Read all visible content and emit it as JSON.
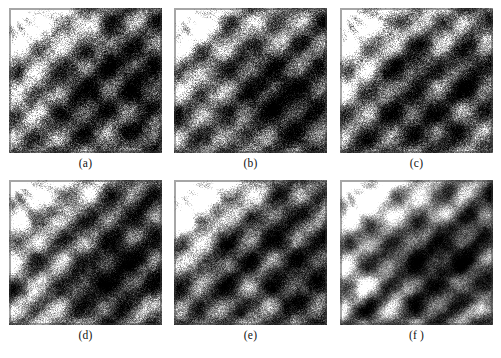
{
  "figure": {
    "background_color": "#ffffff",
    "caption_color": "#121212",
    "rows": 2,
    "columns": 3,
    "panel_width_px": 153,
    "panel_height_px": 145,
    "panels": [
      {
        "id": "panel-a",
        "caption": "(a)",
        "row": 1,
        "column": 1,
        "description": "grayscale speckled SAR-like texture with bright fan-shaped region upper-left and dark diagonal ridges",
        "seed": 11,
        "speckle_density": 0.95,
        "smoothing": 0,
        "mean_gray": "#4a4a4a"
      },
      {
        "id": "panel-b",
        "caption": "(b)",
        "row": 1,
        "column": 2,
        "description": "grayscale speckled SAR-like texture, bright upper-left lobe, dark diagonal striations",
        "seed": 23,
        "speckle_density": 0.92,
        "smoothing": 1,
        "mean_gray": "#464646"
      },
      {
        "id": "panel-c",
        "caption": "(c)",
        "row": 1,
        "column": 3,
        "description": "grayscale speckled SAR-like texture, high contrast diagonal bands",
        "seed": 37,
        "speckle_density": 0.9,
        "smoothing": 1,
        "mean_gray": "#484848"
      },
      {
        "id": "panel-d",
        "caption": "(d)",
        "row": 2,
        "column": 1,
        "description": "grayscale filtered SAR-like texture, reduced speckle, radial bright streaks upper-left",
        "seed": 51,
        "speckle_density": 0.8,
        "smoothing": 2,
        "mean_gray": "#4c4c4c"
      },
      {
        "id": "panel-e",
        "caption": "(e)",
        "row": 2,
        "column": 2,
        "description": "grayscale filtered SAR-like texture, smoother dark diagonal ridges",
        "seed": 67,
        "speckle_density": 0.75,
        "smoothing": 2,
        "mean_gray": "#434343"
      },
      {
        "id": "panel-f",
        "caption": "(f )",
        "row": 2,
        "column": 3,
        "description": "grayscale strongly denoised SAR-like texture, smooth dark regions with bright left edge",
        "seed": 83,
        "speckle_density": 0.6,
        "smoothing": 3,
        "mean_gray": "#3f3f3f"
      }
    ]
  }
}
